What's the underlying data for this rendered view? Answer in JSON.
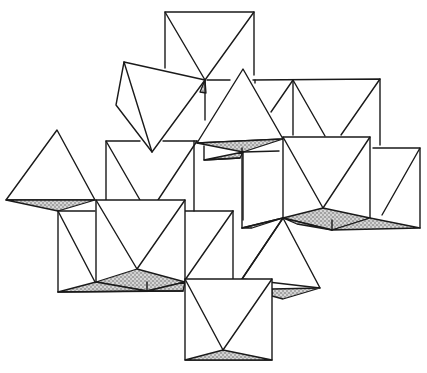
{
  "diagram": {
    "colors": {
      "line": "#1a1a1a",
      "background": "#ffffff",
      "stipple": "#555555"
    },
    "octahedra_count": 12,
    "shaded_faces": "stippled"
  }
}
